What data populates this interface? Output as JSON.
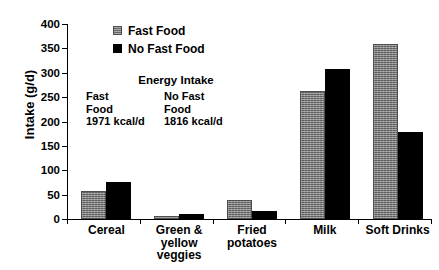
{
  "chart_data": {
    "type": "bar",
    "title": "",
    "xlabel": "",
    "ylabel": "Intake (g/d)",
    "ylim": [
      0,
      400
    ],
    "yticks": [
      0,
      50,
      100,
      150,
      200,
      250,
      300,
      350,
      400
    ],
    "grid": false,
    "legend_position": "top-center",
    "categories": [
      "Cereal",
      "Green & yellow veggies",
      "Fried potatoes",
      "Milk",
      "Soft Drinks"
    ],
    "category_label_lines": [
      [
        "Cereal"
      ],
      [
        "Green &",
        "yellow",
        "veggies"
      ],
      [
        "Fried",
        "potatoes"
      ],
      [
        "Milk"
      ],
      [
        "Soft Drinks"
      ]
    ],
    "series": [
      {
        "name": "Fast Food",
        "color": "#808080",
        "values": [
          57,
          7,
          38,
          262,
          360
        ]
      },
      {
        "name": "No Fast Food",
        "color": "#000000",
        "values": [
          76,
          11,
          17,
          307,
          178
        ]
      }
    ],
    "annotations": {
      "energy_title": "Energy Intake",
      "fast_food_lines": [
        "Fast",
        "Food",
        "1971 kcal/d"
      ],
      "no_fast_food_lines": [
        "No Fast",
        "Food",
        "1816 kcal/d"
      ]
    }
  },
  "legend": {
    "items": [
      {
        "label": "Fast Food",
        "swatch": "gray"
      },
      {
        "label": "No Fast Food",
        "swatch": "black"
      }
    ]
  },
  "axis": {
    "y_title": "Intake (g/d)",
    "y_tick_labels": [
      "400",
      "350",
      "300",
      "250",
      "200",
      "150",
      "100",
      "50",
      "0"
    ]
  }
}
